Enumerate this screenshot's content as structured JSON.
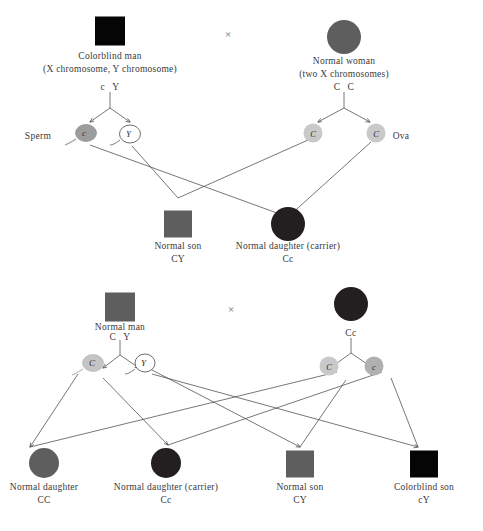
{
  "diagram": {
    "background": "#ffffff",
    "cross_symbol": "×",
    "colors": {
      "black": "#000000",
      "dark": "#231f20",
      "medium_gray": "#5e5e5e",
      "light_gray": "#c9c9c9",
      "mid_gray": "#a8a8a8",
      "line": "#4a4a4a",
      "text": "#3a3a3a"
    }
  },
  "panel1": {
    "father": {
      "symbol": "square",
      "fill": "#050505",
      "label_line1": "Colorblind man",
      "label_line2": "(X chromosome, Y chromosome)",
      "genotype_left": "c",
      "genotype_right": "Y"
    },
    "mother": {
      "symbol": "circle",
      "fill": "#5e5e5e",
      "label_line1": "Normal woman",
      "label_line2": "(two X chromosomes)",
      "genotype_left": "C",
      "genotype_right": "C"
    },
    "sperm_label": "Sperm",
    "ova_label": "Ova",
    "sperm": [
      {
        "allele": "c",
        "fill": "#9d9d9d",
        "filled": true
      },
      {
        "allele": "Y",
        "fill": "#ffffff",
        "filled": false
      }
    ],
    "ova": [
      {
        "allele": "C",
        "fill": "#c9c9c9"
      },
      {
        "allele": "C",
        "fill": "#c9c9c9"
      }
    ],
    "offspring": [
      {
        "symbol": "square",
        "fill": "#5e5e5e",
        "label_line1": "Normal son",
        "label_line2": "",
        "genotype": "CY"
      },
      {
        "symbol": "circle",
        "fill": "#231f20",
        "label_line1": "Normal daughter (carrier)",
        "label_line2": "",
        "genotype": "Cc"
      }
    ]
  },
  "panel2": {
    "father": {
      "symbol": "square",
      "fill": "#5e5e5e",
      "label_line1": "Normal man",
      "label_line2": "",
      "genotype_left": "C",
      "genotype_right": "Y"
    },
    "mother": {
      "symbol": "circle",
      "fill": "#231f20",
      "label_line1": "",
      "label_line2": "",
      "genotype": "Cc"
    },
    "sperm": [
      {
        "allele": "C",
        "fill": "#c4c4c4",
        "filled": true
      },
      {
        "allele": "Y",
        "fill": "#ffffff",
        "filled": false
      }
    ],
    "ova": [
      {
        "allele": "C",
        "fill": "#c9c9c9"
      },
      {
        "allele": "c",
        "fill": "#b0b0b0"
      }
    ],
    "offspring": [
      {
        "symbol": "circle",
        "fill": "#5e5e5e",
        "label_line1": "Normal daughter",
        "label_line2": "",
        "genotype": "CC"
      },
      {
        "symbol": "circle",
        "fill": "#231f20",
        "label_line1": "Normal daughter (carrier)",
        "label_line2": "",
        "genotype": "Cc"
      },
      {
        "symbol": "square",
        "fill": "#5e5e5e",
        "label_line1": "Normal son",
        "label_line2": "",
        "genotype": "CY"
      },
      {
        "symbol": "square",
        "fill": "#050505",
        "label_line1": "Colorblind son",
        "label_line2": "",
        "genotype": "cY"
      }
    ]
  }
}
